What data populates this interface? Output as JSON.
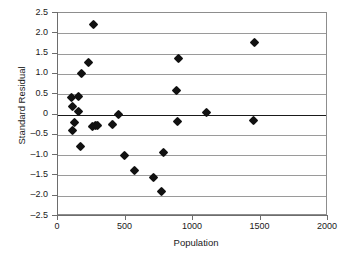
{
  "chart_data": {
    "type": "scatter",
    "title": "",
    "xlabel": "Population",
    "ylabel": "Standard Residual",
    "xlim": [
      0,
      2000
    ],
    "ylim": [
      -2.5,
      2.5
    ],
    "xticks": [
      0,
      500,
      1000,
      1500,
      2000
    ],
    "xtick_labels": [
      "0",
      "500",
      "1000",
      "1500",
      "2000"
    ],
    "yticks": [
      2.5,
      2.0,
      1.5,
      1.0,
      0.5,
      0,
      -0.5,
      -1.0,
      -1.5,
      -2.0,
      -2.5
    ],
    "ytick_labels": [
      "2.5",
      "2.0",
      "1.5",
      "1.0",
      "0.5",
      "0",
      "–0.5",
      "–1.0",
      "–1.5",
      "–2.0",
      "–2.5"
    ],
    "grid": true,
    "grid_axis": "y",
    "zero_line": true,
    "legend": null,
    "marker": "diamond",
    "marker_color": "#111111",
    "points": [
      {
        "x": 100,
        "y": 0.43
      },
      {
        "x": 150,
        "y": 0.44
      },
      {
        "x": 110,
        "y": 0.19
      },
      {
        "x": 155,
        "y": 0.08
      },
      {
        "x": 120,
        "y": -0.2
      },
      {
        "x": 110,
        "y": -0.4
      },
      {
        "x": 165,
        "y": -0.78
      },
      {
        "x": 175,
        "y": 1.0
      },
      {
        "x": 225,
        "y": 1.28
      },
      {
        "x": 262,
        "y": 2.22
      },
      {
        "x": 255,
        "y": -0.29
      },
      {
        "x": 275,
        "y": -0.28
      },
      {
        "x": 295,
        "y": -0.27
      },
      {
        "x": 400,
        "y": -0.25
      },
      {
        "x": 450,
        "y": 0.01
      },
      {
        "x": 495,
        "y": -1.0
      },
      {
        "x": 565,
        "y": -1.38
      },
      {
        "x": 710,
        "y": -1.54
      },
      {
        "x": 765,
        "y": -1.9
      },
      {
        "x": 780,
        "y": -0.93
      },
      {
        "x": 880,
        "y": 0.58
      },
      {
        "x": 890,
        "y": 1.37
      },
      {
        "x": 885,
        "y": -0.17
      },
      {
        "x": 1100,
        "y": 0.05
      },
      {
        "x": 1455,
        "y": 1.77
      },
      {
        "x": 1450,
        "y": -0.15
      }
    ]
  }
}
